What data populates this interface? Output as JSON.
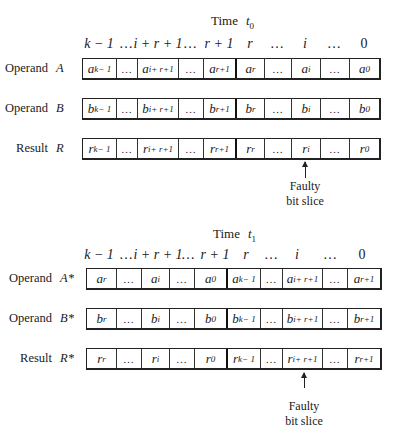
{
  "diagrams": [
    {
      "time": {
        "label": "Time",
        "symbol": "t",
        "subscript": "0"
      },
      "bit_positions": [
        "k − 1",
        "…",
        "i + r + 1",
        "…",
        "r + 1",
        "r",
        "…",
        "i",
        "…",
        "0"
      ],
      "rows": [
        {
          "label": "Operand",
          "symbol": "A",
          "cells": [
            [
              "a",
              "k− 1"
            ],
            [
              "…",
              ""
            ],
            [
              "a",
              "i+ r+1"
            ],
            [
              "…",
              ""
            ],
            [
              "a",
              "r+1"
            ],
            [
              "a",
              "r"
            ],
            [
              "…",
              ""
            ],
            [
              "a",
              "i"
            ],
            [
              "…",
              ""
            ],
            [
              "a",
              "0"
            ]
          ]
        },
        {
          "label": "Operand",
          "symbol": "B",
          "cells": [
            [
              "b",
              "k− 1"
            ],
            [
              "…",
              ""
            ],
            [
              "b",
              "i+ r+1"
            ],
            [
              "…",
              ""
            ],
            [
              "b",
              "r+1"
            ],
            [
              "b",
              "r"
            ],
            [
              "…",
              ""
            ],
            [
              "b",
              "i"
            ],
            [
              "…",
              ""
            ],
            [
              "b",
              "0"
            ]
          ]
        },
        {
          "label": "Result",
          "symbol": "R",
          "cells": [
            [
              "r",
              "k− 1"
            ],
            [
              "…",
              ""
            ],
            [
              "r",
              "i+ r+1"
            ],
            [
              "…",
              ""
            ],
            [
              "r",
              "r+1"
            ],
            [
              "r",
              "r"
            ],
            [
              "…",
              ""
            ],
            [
              "r",
              "i"
            ],
            [
              "…",
              ""
            ],
            [
              "r",
              "0"
            ]
          ]
        }
      ],
      "annotation": {
        "line1": "Faulty",
        "line2": "bit slice",
        "points_to": "r_i"
      }
    },
    {
      "time": {
        "label": "Time",
        "symbol": "t",
        "subscript": "1"
      },
      "bit_positions": [
        "k − 1",
        "…",
        "i + r + 1",
        "…",
        "r + 1",
        "r",
        "…",
        "i",
        "…",
        "0"
      ],
      "rows": [
        {
          "label": "Operand",
          "symbol": "A*",
          "cells": [
            [
              "a",
              "r"
            ],
            [
              "…",
              ""
            ],
            [
              "a",
              "i"
            ],
            [
              "…",
              ""
            ],
            [
              "a",
              "0"
            ],
            [
              "a",
              "k− 1"
            ],
            [
              "…",
              ""
            ],
            [
              "a",
              "i+ r+1"
            ],
            [
              "…",
              ""
            ],
            [
              "a",
              "r+1"
            ]
          ]
        },
        {
          "label": "Operand",
          "symbol": "B*",
          "cells": [
            [
              "b",
              "r"
            ],
            [
              "…",
              ""
            ],
            [
              "b",
              "i"
            ],
            [
              "…",
              ""
            ],
            [
              "b",
              "0"
            ],
            [
              "b",
              "k− 1"
            ],
            [
              "…",
              ""
            ],
            [
              "b",
              "i+ r+1"
            ],
            [
              "…",
              ""
            ],
            [
              "b",
              "r+1"
            ]
          ]
        },
        {
          "label": "Result",
          "symbol": "R*",
          "cells": [
            [
              "r",
              "r"
            ],
            [
              "…",
              ""
            ],
            [
              "r",
              "i"
            ],
            [
              "…",
              ""
            ],
            [
              "r",
              "0"
            ],
            [
              "r",
              "k− 1"
            ],
            [
              "…",
              ""
            ],
            [
              "r",
              "i+ r+1"
            ],
            [
              "…",
              ""
            ],
            [
              "r",
              "r+1"
            ]
          ]
        }
      ],
      "annotation": {
        "line1": "Faulty",
        "line2": "bit slice",
        "points_to": "r_{i+r+1}"
      }
    }
  ]
}
